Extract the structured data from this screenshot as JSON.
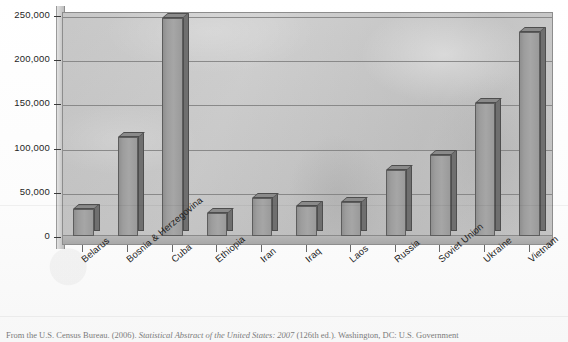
{
  "figure": {
    "title": "",
    "caption_prefix": "From the U.S. Census Bureau. (2006). ",
    "caption_italic": "Statistical Abstract of the United States: 2007",
    "caption_suffix": " (126th ed.). Washington, DC: U.S. Government"
  },
  "chart_data": {
    "type": "bar",
    "title": "",
    "xlabel": "",
    "ylabel": "",
    "ylim": [
      0,
      250000
    ],
    "ytick_labels": [
      "250,000",
      "200,000",
      "150,000",
      "100,000",
      "50,000",
      "0"
    ],
    "ytick_values": [
      250000,
      200000,
      150000,
      100000,
      50000,
      0
    ],
    "grid": true,
    "legend": "none",
    "three_d": true,
    "bar_color": "#9c9c9c",
    "plot_background": "#c9c9c9",
    "categories": [
      "Belarus",
      "Bosnia & Herzegovina",
      "Cuba",
      "Ethiopia",
      "Iran",
      "Iraq",
      "Laos",
      "Russia",
      "Soviet Union",
      "Ukraine",
      "Vietnam"
    ],
    "values": [
      31000,
      112000,
      247000,
      26000,
      43000,
      34000,
      38000,
      75000,
      92000,
      150000,
      231000
    ]
  }
}
